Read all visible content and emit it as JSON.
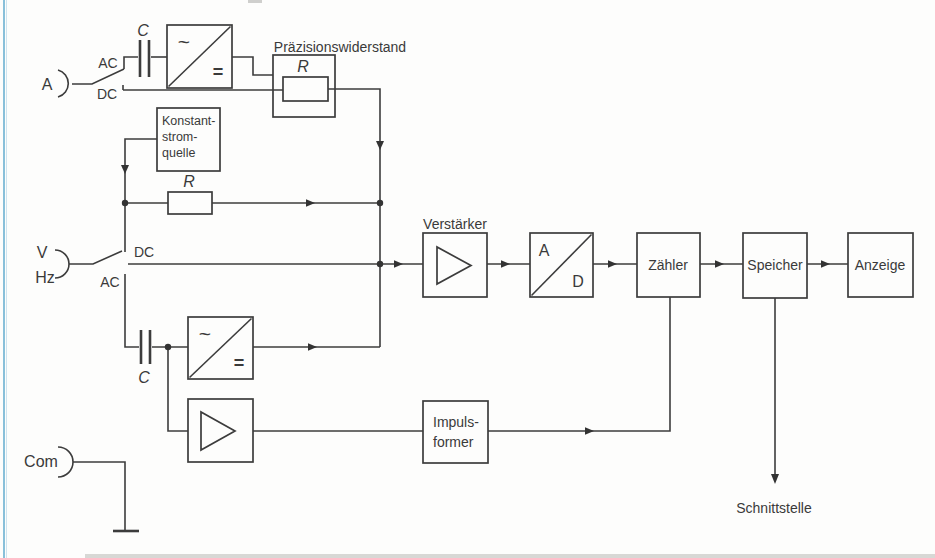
{
  "diagram": {
    "terminals": {
      "a": "A",
      "v": "V",
      "hz": "Hz",
      "com": "Com"
    },
    "current_switch": {
      "ac": "AC",
      "dc": "DC"
    },
    "voltage_switch": {
      "dc": "DC",
      "ac": "AC"
    },
    "capacitors": {
      "top": "C",
      "bottom": "C"
    },
    "precision_resistor": {
      "title": "Präzisionswiderstand",
      "symbol": "R"
    },
    "constant_current_source": {
      "lines": [
        "Konstant-",
        "strom-",
        "quelle"
      ]
    },
    "range_resistor": {
      "symbol": "R"
    },
    "converters": {
      "ac_symbol": "~",
      "dc_symbol": "="
    },
    "amplifier": {
      "label": "Verstärker"
    },
    "adc": {
      "a": "A",
      "d": "D"
    },
    "counter": {
      "label": "Zähler"
    },
    "memory": {
      "label": "Speicher"
    },
    "display": {
      "label": "Anzeige"
    },
    "pulse_shaper": {
      "lines": [
        "Impuls-",
        "former"
      ]
    },
    "interface": {
      "label": "Schnittstelle"
    },
    "colors": {
      "line": "#3c3c3c",
      "page_edge_blue": "#89c0da"
    }
  }
}
